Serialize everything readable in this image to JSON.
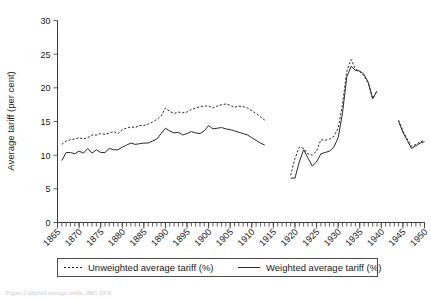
{
  "figure": {
    "caption": "Figure 2 Implied average tariffs, 1865-1950"
  },
  "legend": {
    "items": [
      {
        "label": "Unweighted average tariff (%)",
        "style": "dashed"
      },
      {
        "label": "Weighted average tariff (%)",
        "style": "solid"
      }
    ]
  },
  "chart_data": {
    "type": "line",
    "title": "",
    "xlabel": "",
    "ylabel": "Average tariff (per cent)",
    "xlim": [
      1865,
      1950
    ],
    "ylim": [
      0,
      30
    ],
    "yticks": [
      0,
      5,
      10,
      15,
      20,
      25,
      30
    ],
    "ytick_labels": [
      "0",
      "5",
      "10",
      "15",
      "20",
      "25",
      "30"
    ],
    "xticks": [
      1865,
      1870,
      1875,
      1880,
      1885,
      1890,
      1895,
      1900,
      1905,
      1910,
      1915,
      1920,
      1925,
      1930,
      1935,
      1940,
      1945,
      1950
    ],
    "xtick_labels": [
      "1865",
      "1870",
      "1875",
      "1880",
      "1885",
      "1890",
      "1895",
      "1900",
      "1905",
      "1910",
      "1915",
      "1920",
      "1925",
      "1930",
      "1935",
      "1940",
      "1945",
      "1950"
    ],
    "minor_xticks_interval": 1,
    "grid": false,
    "legend_position": "below-axes",
    "series": [
      {
        "name": "Unweighted average tariff (%)",
        "style": "dashed",
        "segments": [
          {
            "x": [
              1866,
              1867,
              1868,
              1869,
              1870,
              1871,
              1872,
              1873,
              1874,
              1875,
              1876,
              1877,
              1878,
              1879,
              1880,
              1881,
              1882,
              1883,
              1884,
              1885,
              1886,
              1887,
              1888,
              1889,
              1890,
              1891,
              1892,
              1893,
              1894,
              1895,
              1896,
              1897,
              1898,
              1899,
              1900,
              1901,
              1902,
              1903,
              1904,
              1905,
              1906,
              1907,
              1908,
              1909,
              1910,
              1911,
              1912,
              1913
            ],
            "y": [
              11.6,
              12.1,
              12.3,
              12.4,
              12.6,
              12.4,
              12.6,
              13.0,
              13.0,
              13.2,
              13.1,
              13.3,
              13.5,
              13.2,
              13.8,
              14.0,
              14.2,
              14.1,
              14.4,
              14.4,
              14.6,
              14.9,
              15.3,
              15.8,
              17.0,
              16.5,
              16.2,
              16.4,
              16.3,
              16.4,
              16.8,
              17.0,
              17.2,
              17.3,
              17.3,
              17.0,
              17.3,
              17.5,
              17.6,
              17.4,
              17.1,
              17.3,
              17.2,
              17.0,
              16.6,
              16.2,
              15.7,
              15.2
            ]
          },
          {
            "x": [
              1919,
              1920,
              1921,
              1922,
              1923,
              1924,
              1925,
              1926,
              1927,
              1928,
              1929,
              1930,
              1931,
              1932,
              1933,
              1934,
              1935,
              1936,
              1937,
              1938,
              1939
            ],
            "y": [
              7.0,
              9.5,
              11.2,
              11.0,
              10.2,
              10.0,
              10.6,
              12.3,
              12.2,
              12.4,
              12.8,
              14.0,
              17.5,
              22.5,
              24.2,
              22.8,
              22.4,
              21.8,
              20.6,
              18.4,
              19.6
            ]
          },
          {
            "x": [
              1944,
              1945,
              1946,
              1947,
              1948,
              1949,
              1950
            ],
            "y": [
              15.2,
              13.6,
              12.4,
              11.3,
              11.6,
              12.0,
              12.2
            ]
          }
        ]
      },
      {
        "name": "Weighted average tariff (%)",
        "style": "solid",
        "segments": [
          {
            "x": [
              1866,
              1867,
              1868,
              1869,
              1870,
              1871,
              1872,
              1873,
              1874,
              1875,
              1876,
              1877,
              1878,
              1879,
              1880,
              1881,
              1882,
              1883,
              1884,
              1885,
              1886,
              1887,
              1888,
              1889,
              1890,
              1891,
              1892,
              1893,
              1894,
              1895,
              1896,
              1897,
              1898,
              1899,
              1900,
              1901,
              1902,
              1903,
              1904,
              1905,
              1906,
              1907,
              1908,
              1909,
              1910,
              1911,
              1912,
              1913
            ],
            "y": [
              9.2,
              10.4,
              10.4,
              10.2,
              10.6,
              10.3,
              11.0,
              10.3,
              10.8,
              10.4,
              10.4,
              11.0,
              10.8,
              10.8,
              11.2,
              11.5,
              11.8,
              11.6,
              11.7,
              11.8,
              11.8,
              12.1,
              12.4,
              13.2,
              14.0,
              13.6,
              13.3,
              13.4,
              13.0,
              13.2,
              13.5,
              13.3,
              13.2,
              13.6,
              14.4,
              13.9,
              14.0,
              14.1,
              13.9,
              13.8,
              13.6,
              13.4,
              13.2,
              13.0,
              12.6,
              12.2,
              11.8,
              11.5
            ]
          },
          {
            "x": [
              1919,
              1920,
              1921,
              1922,
              1923,
              1924,
              1925,
              1926,
              1927,
              1928,
              1929,
              1930,
              1931,
              1932,
              1933,
              1934,
              1935,
              1936,
              1937,
              1938,
              1939
            ],
            "y": [
              6.6,
              6.6,
              9.0,
              10.8,
              9.6,
              8.4,
              9.0,
              10.2,
              10.4,
              10.6,
              11.2,
              12.6,
              16.2,
              21.6,
              23.2,
              22.6,
              22.5,
              22.0,
              20.8,
              18.4,
              19.5
            ]
          },
          {
            "x": [
              1944,
              1945,
              1946,
              1947,
              1948,
              1949,
              1950
            ],
            "y": [
              15.0,
              13.4,
              12.2,
              11.0,
              11.4,
              11.8,
              12.0
            ]
          }
        ]
      }
    ]
  }
}
